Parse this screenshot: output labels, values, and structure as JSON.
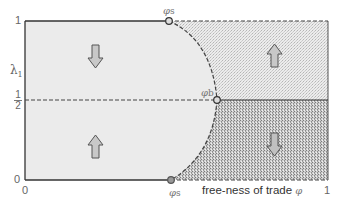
{
  "diagram": {
    "type": "phase-diagram",
    "x_axis": {
      "label": "free-ness of trade",
      "symbol": "φ",
      "ticks": [
        "0",
        "1"
      ],
      "range": [
        0,
        1
      ]
    },
    "y_axis": {
      "symbol": "λ",
      "subscript": "1",
      "ticks": {
        "top": "1",
        "half_num": "1",
        "half_den": "2",
        "bottom": "0"
      },
      "range": [
        0,
        1
      ]
    },
    "points": [
      {
        "id": "phi-s-top",
        "label": "φ",
        "sub": "s",
        "x_frac": 0.475,
        "y_frac": 1.0
      },
      {
        "id": "phi-b",
        "label": "φ",
        "sub": "b",
        "x_frac": 0.63,
        "y_frac": 0.5
      },
      {
        "id": "phi-s-bottom",
        "label": "φ",
        "sub": "s",
        "x_frac": 0.482,
        "y_frac": 0.0
      }
    ],
    "regions": [
      {
        "id": "upper-left",
        "fill": "light-gray",
        "arrow": "down"
      },
      {
        "id": "lower-left",
        "fill": "light-gray",
        "arrow": "up"
      },
      {
        "id": "upper-right",
        "fill": "light-dotted",
        "arrow": "up"
      },
      {
        "id": "lower-right",
        "fill": "dark-dotted",
        "arrow": "down"
      }
    ],
    "colors": {
      "background": "#ffffff",
      "left_fill": "#ebebeb",
      "upper_right_fill": "#e3e3e3",
      "lower_right_fill": "#c6c6c6",
      "line": "#444444",
      "arrow_fill": "#c8c8c8",
      "arrow_stroke": "#555555"
    }
  }
}
